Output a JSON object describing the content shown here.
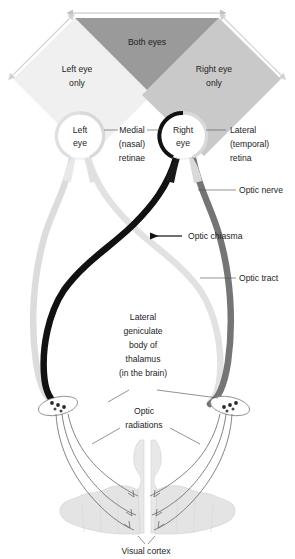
{
  "diagram": {
    "background": "#ffffff"
  },
  "visual_field": {
    "both_eyes": {
      "label": "Both eyes",
      "color": "#9a9a9a",
      "x": 147,
      "y": 42
    },
    "left_eye_only": {
      "label_line1": "Left eye",
      "label_line2": "only",
      "color": "#f0f0f0",
      "x": 77,
      "y": 70
    },
    "right_eye_only": {
      "label_line1": "Right eye",
      "label_line2": "only",
      "color": "#c9c9c9",
      "x": 214,
      "y": 70
    },
    "arrows": {
      "top_arrow_color": "#c2c2c2",
      "left_arrow_color": "#d2d2d2",
      "right_arrow_color": "#d2d2d2"
    }
  },
  "eyes": {
    "left": {
      "label_line1": "Left",
      "label_line2": "eye",
      "cx": 80,
      "cy": 136,
      "r": 23,
      "nasal_retina_color": "#d9d9d9",
      "temporal_retina_color": "#e8e8e8"
    },
    "right": {
      "label_line1": "Right",
      "label_line2": "eye",
      "cx": 183,
      "cy": 136,
      "r": 23,
      "nasal_retina_color": "#111111",
      "temporal_retina_color": "#d9d9d9"
    }
  },
  "labels": {
    "medial_retinae": {
      "line1": "Medial",
      "line2": "(nasal)",
      "line3": "retinae",
      "x": 132,
      "y": 133
    },
    "lateral_retina": {
      "line1": "Lateral",
      "line2": "(temporal)",
      "line3": "retina",
      "x": 239,
      "y": 133
    },
    "optic_nerve": {
      "text": "Optic nerve",
      "x": 243,
      "y": 192
    },
    "optic_chiasma": {
      "text": "Optic chiasma",
      "x": 188,
      "y": 239
    },
    "optic_tract": {
      "text": "Optic tract",
      "x": 243,
      "y": 277
    },
    "lgn": {
      "line1": "Lateral",
      "line2": "geniculate",
      "line3": "body of",
      "line4": "thalamus",
      "line5": "(in the brain)",
      "x": 141,
      "y": 345
    },
    "optic_radiations": {
      "line1": "Optic",
      "line2": "radiations",
      "x": 141,
      "y": 422
    },
    "visual_cortex": {
      "text": "Visual cortex",
      "x": 146,
      "y": 551
    }
  },
  "pathway_colors": {
    "left_nasal_fiber": "#e2e2e2",
    "left_temporal_fiber": "#dcdcdc",
    "right_nasal_fiber": "#111111",
    "right_temporal_fiber": "#757575",
    "cortex_fill": "#e4e4e4",
    "cortex_stroke": "#d0d0d0",
    "radiation_stroke": "#6e6e6e"
  }
}
